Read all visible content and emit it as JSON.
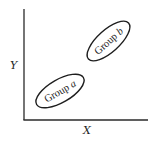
{
  "diagram": {
    "type": "scatter-cluster-sketch",
    "axes": {
      "x_label": "X",
      "y_label": "Y"
    },
    "groups": [
      {
        "name_prefix": "Group",
        "name_letter": "a",
        "position": "lower-left",
        "center": [
          60,
          91
        ],
        "rotation_deg": -30
      },
      {
        "name_prefix": "Group",
        "name_letter": "b",
        "position": "upper-right",
        "center": [
          108,
          41
        ],
        "rotation_deg": -42
      }
    ],
    "colors": {
      "ink": "#1e1e1e",
      "background": "#ffffff"
    }
  }
}
